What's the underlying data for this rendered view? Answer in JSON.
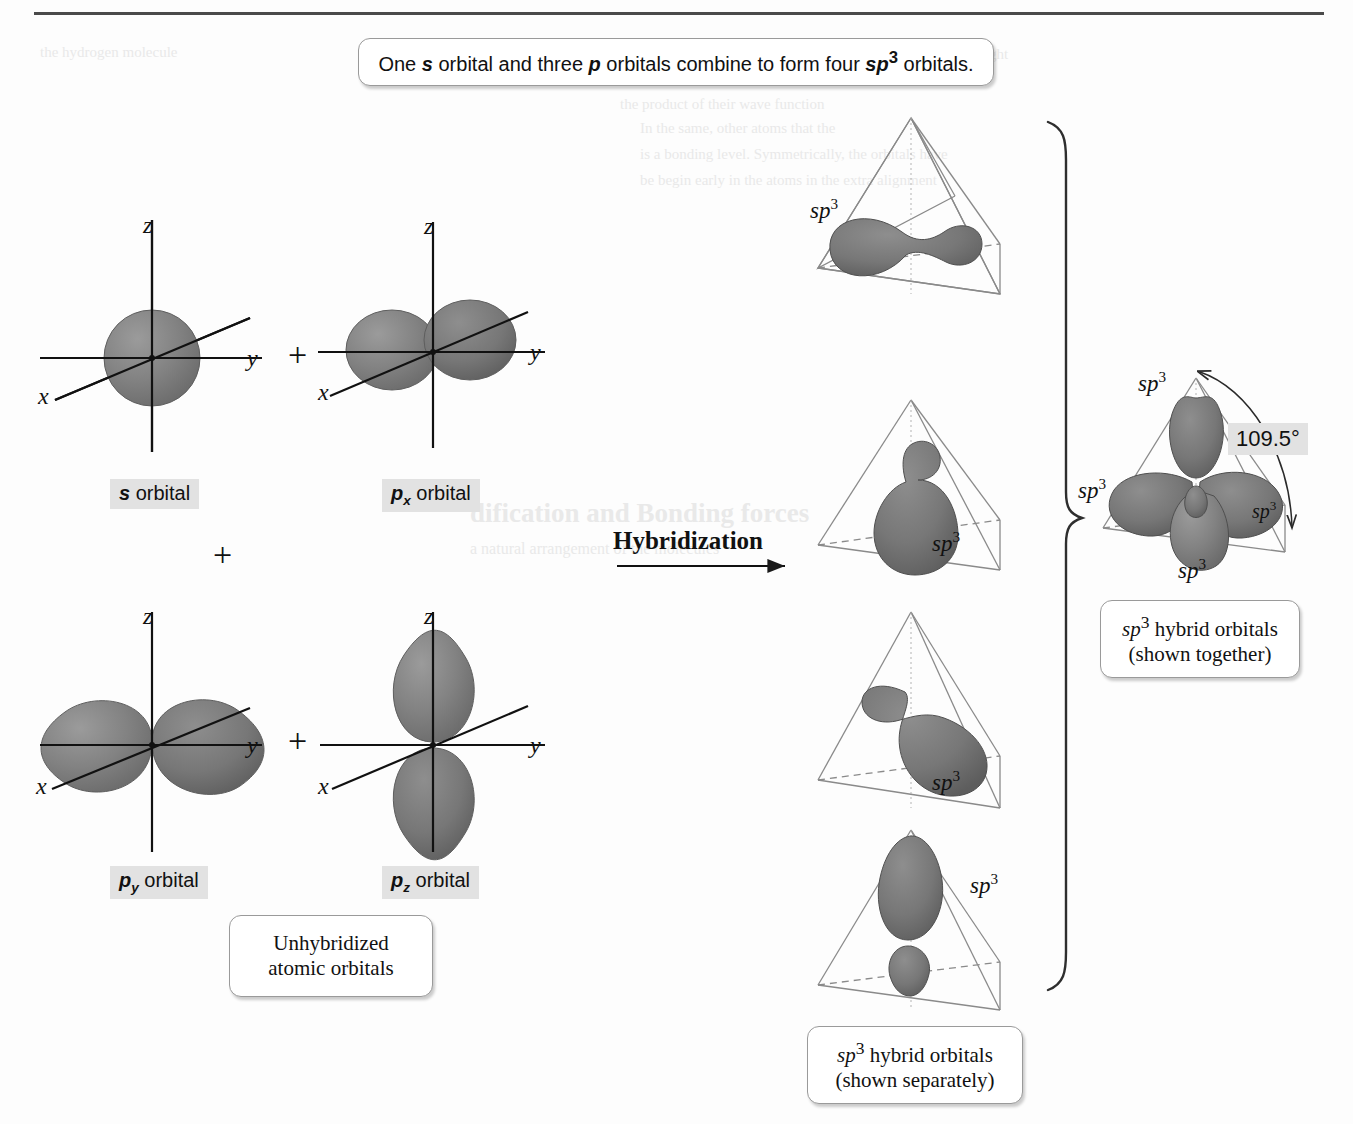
{
  "figure": {
    "title_caption": "One s orbital and three p orbitals combine to form four sp3 orbitals.",
    "process_label": "Hybridization",
    "angle_value": "109.5°",
    "plus_sign": "+"
  },
  "colors": {
    "orbital_fill": "#808080",
    "orbital_edge": "#4a4a4a",
    "highlight_bg": "#e2e2e2",
    "rule": "#4a4a4a",
    "page_bg": "#fdfdfd",
    "text": "#111111"
  },
  "caption_top": {
    "part1": "One ",
    "s_italic": "s",
    "part2": " orbital and three ",
    "p_italic": "p",
    "part3": " orbitals combine to form four ",
    "sp_italic": "sp",
    "sp_exp": "3",
    "part4": " orbitals."
  },
  "atomic_orbitals": [
    {
      "id": "s-orbital",
      "label_letter": "s",
      "label_sub": "",
      "label_word": " orbital",
      "axes": [
        "z",
        "y",
        "x"
      ],
      "shape": "sphere"
    },
    {
      "id": "px-orbital",
      "label_letter": "p",
      "label_sub": "x",
      "label_word": " orbital",
      "axes": [
        "z",
        "y",
        "x"
      ],
      "shape": "dumbbell-foreshortened"
    },
    {
      "id": "py-orbital",
      "label_letter": "p",
      "label_sub": "y",
      "label_word": " orbital",
      "axes": [
        "z",
        "y",
        "x"
      ],
      "shape": "dumbbell-horizontal"
    },
    {
      "id": "pz-orbital",
      "label_letter": "p",
      "label_sub": "z",
      "label_word": " orbital",
      "axes": [
        "z",
        "y",
        "x"
      ],
      "shape": "dumbbell-vertical"
    }
  ],
  "unhybridized_box": {
    "line1": "Unhybridized",
    "line2": "atomic orbitals"
  },
  "hybrid_separate_box": {
    "line1_italic": "sp",
    "line1_exp": "3",
    "line1_rest": " hybrid orbitals",
    "line2": "(shown separately)"
  },
  "hybrid_together_box": {
    "line1_italic": "sp",
    "line1_exp": "3",
    "line1_rest": " hybrid orbitals",
    "line2": "(shown together)"
  },
  "tetrahedra": [
    {
      "id": "tetra-1",
      "sp3_label": "sp3",
      "label_side": "left",
      "orbital_direction": "front-left-horizontal"
    },
    {
      "id": "tetra-2",
      "sp3_label": "sp3",
      "label_side": "right",
      "orbital_direction": "down-front"
    },
    {
      "id": "tetra-3",
      "sp3_label": "sp3",
      "label_side": "right",
      "orbital_direction": "front-right-horizontal"
    },
    {
      "id": "tetra-4",
      "sp3_label": "sp3",
      "label_side": "right",
      "orbital_direction": "up-apex"
    }
  ],
  "combined": {
    "sp3_labels": [
      "sp3",
      "sp3",
      "sp3",
      "sp3"
    ],
    "angle": "109.5°"
  },
  "ghost_text": {
    "g1": "the hydrogen molecule",
    "g2": "of the orbitals combining with the weight",
    "g3": "the product of their wave function",
    "g4": "In the same, other atoms that the",
    "g5": "is a bonding level. Symmetrically, the orbitals have",
    "g6": "be begin early in the atoms in the extra alignment",
    "g7": "dification and Bonding forces",
    "g8": "a natural arrangement of the molecules"
  }
}
